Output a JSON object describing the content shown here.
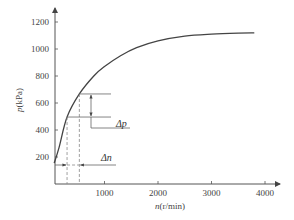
{
  "chart_data": {
    "type": "line",
    "title": "",
    "xlabel": "n(r/min)",
    "ylabel": "p(kPa)",
    "xlabel_var": "n",
    "xlabel_unit": "(r/min)",
    "ylabel_var": "p",
    "ylabel_unit": "(kPa)",
    "xlim": [
      0,
      4200
    ],
    "ylim": [
      0,
      1320
    ],
    "x_ticks": [
      1000,
      2000,
      3000,
      4000
    ],
    "x_tick_labels": [
      "1000",
      "2000",
      "3000",
      "4000"
    ],
    "y_ticks": [
      200,
      400,
      600,
      800,
      1000,
      1200
    ],
    "y_tick_labels": [
      "200",
      "400",
      "600",
      "800",
      "1000",
      "1200"
    ],
    "grid": false,
    "legend": null,
    "series": [
      {
        "name": "p vs n",
        "x": [
          60,
          150,
          300,
          530,
          800,
          1000,
          1300,
          1600,
          2000,
          2500,
          3000,
          3500,
          3800
        ],
        "y": [
          155,
          270,
          496,
          667,
          800,
          870,
          950,
          1010,
          1060,
          1095,
          1110,
          1118,
          1120
        ]
      }
    ],
    "annotations": {
      "delta_p": {
        "label": "Δp",
        "p_low": 496,
        "p_high": 667
      },
      "delta_n": {
        "label": "Δn",
        "n_low": 300,
        "n_high": 530
      }
    }
  }
}
